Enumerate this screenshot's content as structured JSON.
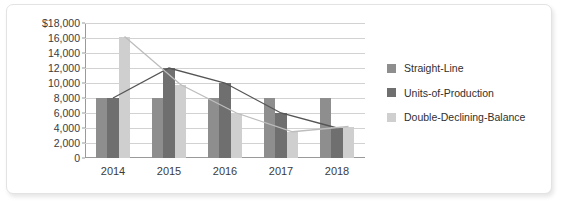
{
  "chart_data": {
    "type": "bar",
    "title": "",
    "subtitle": "",
    "xlabel": "",
    "ylabel": "",
    "categories": [
      "2014",
      "2015",
      "2016",
      "2017",
      "2018"
    ],
    "series": [
      {
        "name": "Straight-Line",
        "color": "#8e8e8e",
        "values": [
          8000,
          8000,
          8000,
          8000,
          8000
        ]
      },
      {
        "name": "Units-of-Production",
        "color": "#6f6f6f",
        "values": [
          8000,
          12000,
          10000,
          6000,
          4000
        ]
      },
      {
        "name": "Double-Declining-Balance",
        "color": "#cfcfcf",
        "values": [
          16200,
          9800,
          6000,
          3500,
          4200
        ]
      }
    ],
    "overlay_lines": [
      {
        "name": "Units-of-Production",
        "color": "#555555",
        "values": [
          8000,
          12000,
          10000,
          6000,
          4000
        ]
      },
      {
        "name": "Double-Declining-Balance",
        "color": "#bdbdbd",
        "values": [
          16200,
          9800,
          6000,
          3500,
          4200
        ]
      }
    ],
    "ylim": [
      0,
      18000
    ],
    "ytick_values": [
      0,
      2000,
      4000,
      6000,
      8000,
      10000,
      12000,
      14000,
      16000,
      18000
    ],
    "ytick_labels": [
      "0",
      "2,000",
      "4,000",
      "6,000",
      "8,000",
      "10,000",
      "12,000",
      "14,000",
      "16,000",
      "$18,000"
    ],
    "grid": true,
    "legend_position": "right"
  },
  "legend": {
    "items": [
      {
        "label": "Straight-Line"
      },
      {
        "label": "Units-of-Production"
      },
      {
        "label": "Double-Declining-Balance"
      }
    ]
  }
}
